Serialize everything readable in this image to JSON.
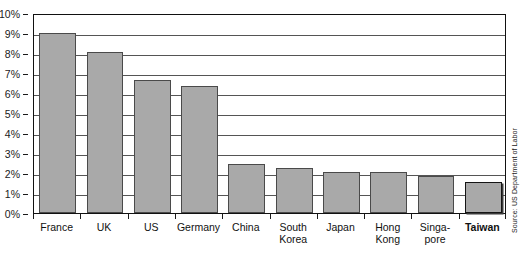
{
  "chart_data": {
    "type": "bar",
    "title": "",
    "subtitle": "",
    "xlabel": "",
    "ylabel": "",
    "ylim": [
      0,
      10
    ],
    "y_tick_step": 1,
    "y_tick_labels": [
      "0%",
      "1%",
      "2%",
      "3%",
      "4%",
      "5%",
      "6%",
      "7%",
      "8%",
      "9%",
      "10%"
    ],
    "grid": true,
    "grid_axis": "y",
    "legend": "none",
    "value_unit": "percent",
    "categories": [
      "France",
      "UK",
      "US",
      "Germany",
      "China",
      "South\nKorea",
      "Japan",
      "Hong\nKong",
      "Singa-\npore",
      "Taiwan"
    ],
    "values": [
      9.0,
      8.05,
      6.65,
      6.35,
      2.45,
      2.25,
      2.05,
      2.05,
      1.85,
      1.55
    ],
    "highlight_category": "Taiwan",
    "series": [
      {
        "name": "Rate",
        "values": [
          9.0,
          8.05,
          6.65,
          6.35,
          2.45,
          2.25,
          2.05,
          2.05,
          1.85,
          1.55
        ]
      }
    ],
    "annotations": [
      {
        "text": "Source: US Department of Labor",
        "position": "right-vertical"
      }
    ]
  },
  "source_note": "Source: US Department of Labor",
  "top_crop_artifact": "",
  "colors": {
    "bar_fill": "#a9a9a9",
    "bar_border": "#4a4a4a",
    "bar_border_highlight": "#151515",
    "axis": "#111111",
    "gridline": "#555555",
    "text": "#111111",
    "background": "#ffffff"
  }
}
